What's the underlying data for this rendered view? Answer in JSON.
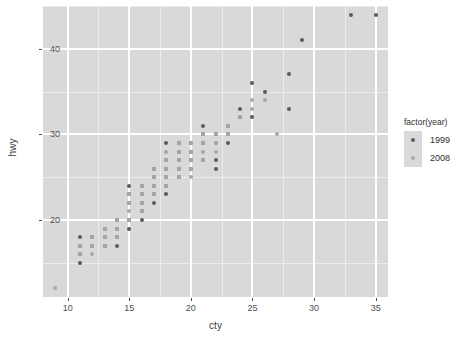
{
  "chart_data": {
    "type": "scatter",
    "title": "",
    "xlabel": "cty",
    "ylabel": "hwy",
    "xlim": [
      8,
      36
    ],
    "ylim": [
      11,
      45
    ],
    "xticks": [
      10,
      15,
      20,
      25,
      30,
      35
    ],
    "yticks": [
      20,
      30,
      40
    ],
    "xticks_minor": [
      12.5,
      17.5,
      22.5,
      27.5,
      32.5
    ],
    "yticks_minor": [
      15,
      25,
      35,
      45
    ],
    "grid": true,
    "legend": {
      "title": "factor(year)",
      "position": "right",
      "entries": [
        {
          "label": "1999",
          "color": "#5a5a5a"
        },
        {
          "label": "2008",
          "color": "#a8a8a8"
        }
      ]
    },
    "panel_background": "#d9d9d9",
    "series": [
      {
        "name": "1999",
        "color": "#5a5a5a",
        "points": [
          [
            11,
            18
          ],
          [
            11,
            17
          ],
          [
            11,
            16
          ],
          [
            11,
            15
          ],
          [
            12,
            18
          ],
          [
            12,
            17
          ],
          [
            13,
            19
          ],
          [
            13,
            18
          ],
          [
            13,
            17
          ],
          [
            14,
            20
          ],
          [
            14,
            19
          ],
          [
            14,
            18
          ],
          [
            14,
            17
          ],
          [
            15,
            24
          ],
          [
            15,
            23
          ],
          [
            15,
            22
          ],
          [
            15,
            20
          ],
          [
            15,
            19
          ],
          [
            16,
            24
          ],
          [
            16,
            23
          ],
          [
            16,
            22
          ],
          [
            16,
            21
          ],
          [
            16,
            20
          ],
          [
            17,
            26
          ],
          [
            17,
            25
          ],
          [
            17,
            24
          ],
          [
            17,
            23
          ],
          [
            17,
            22
          ],
          [
            18,
            29
          ],
          [
            18,
            27
          ],
          [
            18,
            26
          ],
          [
            18,
            25
          ],
          [
            18,
            24
          ],
          [
            18,
            23
          ],
          [
            19,
            29
          ],
          [
            19,
            28
          ],
          [
            19,
            27
          ],
          [
            19,
            26
          ],
          [
            19,
            25
          ],
          [
            20,
            29
          ],
          [
            20,
            28
          ],
          [
            20,
            27
          ],
          [
            20,
            26
          ],
          [
            21,
            31
          ],
          [
            21,
            30
          ],
          [
            21,
            29
          ],
          [
            21,
            27
          ],
          [
            22,
            30
          ],
          [
            22,
            29
          ],
          [
            22,
            27
          ],
          [
            22,
            26
          ],
          [
            23,
            31
          ],
          [
            23,
            30
          ],
          [
            23,
            29
          ],
          [
            24,
            33
          ],
          [
            24,
            32
          ],
          [
            25,
            36
          ],
          [
            25,
            32
          ],
          [
            26,
            35
          ],
          [
            28,
            37
          ],
          [
            28,
            33
          ],
          [
            29,
            41
          ],
          [
            33,
            44
          ],
          [
            35,
            44
          ]
        ]
      },
      {
        "name": "2008",
        "color": "#a8a8a8",
        "points": [
          [
            9,
            12
          ],
          [
            11,
            17
          ],
          [
            11,
            16
          ],
          [
            12,
            18
          ],
          [
            12,
            17
          ],
          [
            12,
            16
          ],
          [
            13,
            19
          ],
          [
            13,
            18
          ],
          [
            13,
            17
          ],
          [
            14,
            20
          ],
          [
            14,
            19
          ],
          [
            14,
            18
          ],
          [
            15,
            23
          ],
          [
            15,
            22
          ],
          [
            15,
            21
          ],
          [
            15,
            20
          ],
          [
            16,
            24
          ],
          [
            16,
            23
          ],
          [
            16,
            22
          ],
          [
            16,
            21
          ],
          [
            17,
            26
          ],
          [
            17,
            25
          ],
          [
            17,
            24
          ],
          [
            17,
            23
          ],
          [
            18,
            28
          ],
          [
            18,
            27
          ],
          [
            18,
            26
          ],
          [
            18,
            25
          ],
          [
            18,
            24
          ],
          [
            19,
            29
          ],
          [
            19,
            28
          ],
          [
            19,
            27
          ],
          [
            19,
            26
          ],
          [
            19,
            25
          ],
          [
            20,
            29
          ],
          [
            20,
            28
          ],
          [
            20,
            27
          ],
          [
            20,
            26
          ],
          [
            20,
            25
          ],
          [
            21,
            30
          ],
          [
            21,
            29
          ],
          [
            21,
            28
          ],
          [
            21,
            27
          ],
          [
            22,
            30
          ],
          [
            22,
            29
          ],
          [
            22,
            28
          ],
          [
            23,
            31
          ],
          [
            23,
            30
          ],
          [
            24,
            32
          ],
          [
            25,
            34
          ],
          [
            25,
            33
          ],
          [
            26,
            34
          ],
          [
            27,
            30
          ]
        ]
      }
    ]
  }
}
